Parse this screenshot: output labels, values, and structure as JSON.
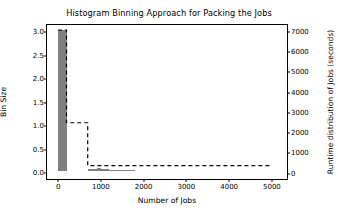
{
  "chart_data": {
    "type": "bar",
    "title": "Histogram Binning Approach for Packing the Jobs",
    "xlabel": "Number of Jobs",
    "ylabel": "Bin Size",
    "ylabel_right": "Runtime distribution of Jobs (seconds)",
    "xlim": [
      -260,
      5400
    ],
    "ylim": [
      -0.16,
      3.15
    ],
    "ylim_right": [
      -370,
      7350
    ],
    "grid": false,
    "legend": null,
    "xticks": [
      0,
      1000,
      2000,
      3000,
      4000,
      5000
    ],
    "xtick_labels": [
      "0",
      "1000",
      "2000",
      "3000",
      "4000",
      "5000"
    ],
    "yticks": [
      0.0,
      0.5,
      1.0,
      1.5,
      2.0,
      2.5,
      3.0
    ],
    "ytick_labels": [
      "0.0",
      "0.5",
      "1.0",
      "1.5",
      "2.0",
      "2.5",
      "3.0"
    ],
    "yticks_right": [
      0,
      1000,
      2000,
      3000,
      4000,
      5000,
      6000,
      7000
    ],
    "ytick_labels_right": [
      "0",
      "1000",
      "2000",
      "3000",
      "4000",
      "5000",
      "6000",
      "7000"
    ],
    "bar_color": "#808080",
    "line_color": "#000000",
    "line_style": "dashed",
    "series": [
      {
        "name": "Bin Size",
        "axis": "left",
        "type": "bar",
        "bin_edges": [
          0,
          200,
          700,
          900,
          1000,
          1100,
          1200,
          1300,
          1400,
          1600,
          1800
        ],
        "bins": [
          {
            "x0": 0,
            "x1": 200,
            "value": 3.0
          },
          {
            "x0": 700,
            "x1": 900,
            "value": 0.05
          },
          {
            "x0": 900,
            "x1": 1000,
            "value": 0.07
          },
          {
            "x0": 1000,
            "x1": 1100,
            "value": 0.06
          },
          {
            "x0": 1100,
            "x1": 1200,
            "value": 0.05
          },
          {
            "x0": 1200,
            "x1": 1300,
            "value": 0.04
          },
          {
            "x0": 1300,
            "x1": 1500,
            "value": 0.02
          },
          {
            "x0": 1500,
            "x1": 1800,
            "value": 0.01
          }
        ]
      },
      {
        "name": "Runtime distribution of Jobs",
        "axis": "right",
        "type": "step",
        "points": [
          {
            "x": 0,
            "y": 7100
          },
          {
            "x": 200,
            "y": 7100
          },
          {
            "x": 200,
            "y": 2450
          },
          {
            "x": 700,
            "y": 2450
          },
          {
            "x": 700,
            "y": 300
          },
          {
            "x": 5000,
            "y": 300
          }
        ]
      }
    ]
  }
}
